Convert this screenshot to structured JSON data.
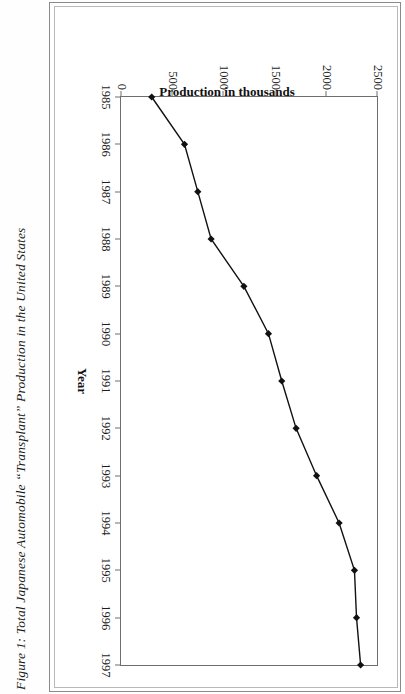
{
  "figure": {
    "caption": "Figure 1:   Total Japanese Automobile “Transplant” Production in the United States"
  },
  "chart_data": {
    "type": "line",
    "title": "",
    "xlabel": "Year",
    "ylabel": "Production in thousands",
    "categories": [
      "1985",
      "1986",
      "1987",
      "1988",
      "1989",
      "1990",
      "1991",
      "1992",
      "1993",
      "1994",
      "1995",
      "1996",
      "1997"
    ],
    "values": [
      300,
      620,
      750,
      880,
      1200,
      1440,
      1570,
      1710,
      1910,
      2130,
      2280,
      2300,
      2340
    ],
    "series": [
      {
        "name": "Transplant production",
        "values": [
          300,
          620,
          750,
          880,
          1200,
          1440,
          1570,
          1710,
          1910,
          2130,
          2280,
          2300,
          2340
        ]
      }
    ],
    "ylim": [
      0,
      2500
    ],
    "yticks": [
      0,
      500,
      1000,
      1500,
      2000,
      2500
    ],
    "ytick_labels": [
      "0",
      "500",
      "1000",
      "1500",
      "2000",
      "2500"
    ],
    "xtick_labels": [
      "1985",
      "1986",
      "1987",
      "1988",
      "1989",
      "1990",
      "1991",
      "1992",
      "1993",
      "1994",
      "1995",
      "1996",
      "1997"
    ],
    "grid": false,
    "legend": "none",
    "marker": "diamond",
    "line_color": "#111111",
    "marker_color": "#111111"
  }
}
